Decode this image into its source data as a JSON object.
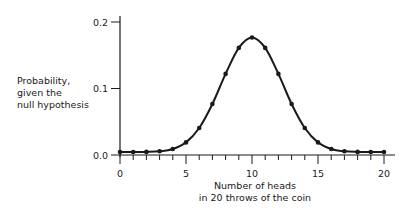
{
  "chart_data": {
    "type": "line",
    "title": "",
    "xlabel": "Number of heads\nin 20 throws of the coin",
    "ylabel": "Probability,\ngiven the\nnull hypothesis",
    "xlim": [
      0,
      20
    ],
    "ylim": [
      0,
      0.2
    ],
    "x_ticks": [
      0,
      5,
      10,
      15,
      20
    ],
    "x_tick_labels": [
      "0",
      "5",
      "10",
      "15",
      "20"
    ],
    "x_minor_ticks": [
      1,
      2,
      3,
      4,
      6,
      7,
      8,
      9,
      11,
      12,
      13,
      14,
      16,
      17,
      18,
      19
    ],
    "y_ticks": [
      0.0,
      0.1,
      0.2
    ],
    "y_tick_labels": [
      "0.0",
      "0.1",
      "0.2"
    ],
    "grid": false,
    "legend": null,
    "series": [
      {
        "name": "Binomial(20, 0.5)",
        "x": [
          0,
          1,
          2,
          3,
          4,
          5,
          6,
          7,
          8,
          9,
          10,
          11,
          12,
          13,
          14,
          15,
          16,
          17,
          18,
          19,
          20
        ],
        "values": [
          1e-06,
          1.9e-05,
          0.000181,
          0.001087,
          0.004621,
          0.014786,
          0.036964,
          0.073929,
          0.120134,
          0.160179,
          0.176197,
          0.160179,
          0.120134,
          0.073929,
          0.036964,
          0.014786,
          0.004621,
          0.001087,
          0.000181,
          1.9e-05,
          1e-06
        ],
        "markers": true,
        "color": "#1a1a1a"
      }
    ]
  },
  "labels": {
    "y_axis": "Probability,\ngiven the\nnull hypothesis",
    "x_axis": "Number of heads\nin 20 throws of the coin"
  }
}
